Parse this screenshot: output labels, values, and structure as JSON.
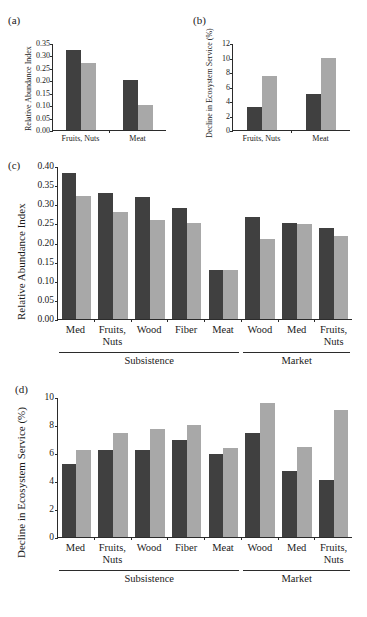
{
  "figure": {
    "panel_letters": [
      "(a)",
      "(b)",
      "(c)",
      "(d)"
    ],
    "colors": {
      "dark": "#404040",
      "light": "#a8a8a8",
      "axis": "#2b2b2b"
    }
  },
  "chart_data": [
    {
      "panel": "(a)",
      "type": "bar",
      "title": "",
      "ylabel": "Relative Abundance Index",
      "xlabel": "",
      "categories": [
        "Fruits, Nuts",
        "Meat"
      ],
      "yticks": [
        "0.00",
        "0.05",
        "0.10",
        "0.15",
        "0.20",
        "0.25",
        "0.30",
        "0.35"
      ],
      "ylim": [
        0,
        0.35
      ],
      "grid": false,
      "series": [
        {
          "name": "dark",
          "values": [
            0.322,
            0.2
          ]
        },
        {
          "name": "light",
          "values": [
            0.27,
            0.099
          ]
        }
      ]
    },
    {
      "panel": "(b)",
      "type": "bar",
      "title": "",
      "ylabel": "Decline in Ecosystem Service (%)",
      "xlabel": "",
      "categories": [
        "Fruits, Nuts",
        "Meat"
      ],
      "yticks": [
        "0",
        "2",
        "4",
        "6",
        "8",
        "10",
        "12"
      ],
      "ylim": [
        0,
        12
      ],
      "grid": false,
      "series": [
        {
          "name": "dark",
          "values": [
            3.2,
            5.0
          ]
        },
        {
          "name": "light",
          "values": [
            7.5,
            10.0
          ]
        }
      ]
    },
    {
      "panel": "(c)",
      "type": "bar",
      "title": "",
      "ylabel": "Relative Abundance Index",
      "xlabel": "",
      "categories": [
        "Med",
        "Fruits,\nNuts",
        "Wood",
        "Fiber",
        "Meat",
        "Wood",
        "Med",
        "Fruits,\nNuts"
      ],
      "groups": [
        {
          "label": "Subsistence",
          "span": 5
        },
        {
          "label": "Market",
          "span": 3
        }
      ],
      "yticks": [
        "0.00",
        "0.05",
        "0.10",
        "0.15",
        "0.20",
        "0.25",
        "0.30",
        "0.35",
        "0.40"
      ],
      "ylim": [
        0,
        0.4
      ],
      "grid": false,
      "series": [
        {
          "name": "dark",
          "values": [
            0.383,
            0.329,
            0.319,
            0.289,
            0.128,
            0.267,
            0.25,
            0.238
          ]
        },
        {
          "name": "light",
          "values": [
            0.321,
            0.281,
            0.26,
            0.25,
            0.129,
            0.208,
            0.248,
            0.218
          ]
        }
      ]
    },
    {
      "panel": "(d)",
      "type": "bar",
      "title": "",
      "ylabel": "Decline in Ecosystem Service (%)",
      "xlabel": "",
      "categories": [
        "Med",
        "Fruits,\nNuts",
        "Wood",
        "Fiber",
        "Meat",
        "Wood",
        "Med",
        "Fruits,\nNuts"
      ],
      "groups": [
        {
          "label": "Subsistence",
          "span": 5
        },
        {
          "label": "Market",
          "span": 3
        }
      ],
      "yticks": [
        "0",
        "2",
        "4",
        "6",
        "8",
        "10"
      ],
      "ylim": [
        0,
        10
      ],
      "grid": false,
      "series": [
        {
          "name": "dark",
          "values": [
            5.2,
            6.2,
            6.2,
            6.9,
            5.95,
            7.4,
            4.75,
            4.1
          ]
        },
        {
          "name": "light",
          "values": [
            6.2,
            7.4,
            7.7,
            8.0,
            6.35,
            9.55,
            6.4,
            9.1
          ]
        }
      ]
    }
  ]
}
